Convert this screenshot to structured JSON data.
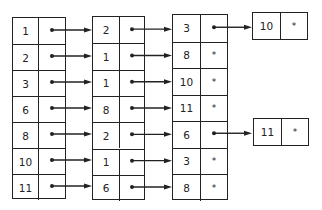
{
  "diagram": {
    "type": "linked-list-table",
    "columns": [
      {
        "keys": [
          "1",
          "2",
          "3",
          "6",
          "8",
          "10",
          "11"
        ],
        "pointers": [
          "next",
          "next",
          "next",
          "next",
          "next",
          "next",
          "next"
        ]
      },
      {
        "keys": [
          "2",
          "1",
          "1",
          "8",
          "2",
          "1",
          "6"
        ],
        "pointers": [
          "next",
          "next",
          "next",
          "next",
          "next",
          "next",
          "next"
        ]
      },
      {
        "keys": [
          "3",
          "8",
          "10",
          "11",
          "6",
          "3",
          "8"
        ],
        "pointers": [
          "next",
          "*",
          "*",
          "*",
          "next",
          "*",
          "*"
        ]
      }
    ],
    "overflow_nodes": [
      {
        "key": "10",
        "pointer": "*",
        "from_row": 0
      },
      {
        "key": "11",
        "pointer": "*",
        "from_row": 4
      }
    ],
    "null_symbol": "*",
    "line_color": "#222222"
  }
}
